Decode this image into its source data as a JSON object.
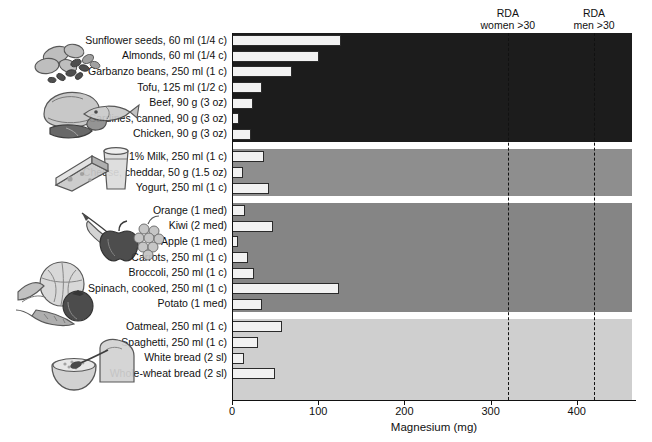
{
  "chart_data": {
    "type": "bar",
    "orientation": "horizontal",
    "title": "",
    "xlabel": "Magnesium (mg)",
    "ylabel": "",
    "xlim": [
      0,
      470
    ],
    "xticks": [
      0,
      100,
      200,
      300,
      400
    ],
    "grid": false,
    "legend": "none",
    "categories": [
      "Sunflower seeds, 60 ml (1/4 c)",
      "Almonds, 60 ml  (1/4 c)",
      "Garbanzo beans, 250 ml (1 c)",
      "Tofu, 125 ml (1/2 c)",
      "Beef, 90 g (3 oz)",
      "Sardines, canned, 90 g (3 oz)",
      "Chicken, 90 g (3 oz)",
      "1% Milk, 250 ml (1 c)",
      "Cheese, cheddar, 50 g (1.5 oz)",
      "Yogurt, 250 ml (1 c)",
      "Orange (1 med)",
      "Kiwi (2 med)",
      "Apple (1 med)",
      "Carrots, 250 ml (1 c)",
      "Broccoli, 250 ml (1 c)",
      "Spinach, cooked, 250 ml (1 c)",
      "Potato (1 med)",
      "Oatmeal, 250 ml (1 c)",
      "Spaghetti, 250 ml (1 c)",
      "White bread (2 sl)",
      "Whole-wheat bread (2 sl)"
    ],
    "values": [
      127,
      101,
      70,
      35,
      24,
      8,
      22,
      37,
      13,
      43,
      15,
      48,
      7,
      18,
      26,
      124,
      35,
      58,
      30,
      14,
      50
    ],
    "groups": [
      {
        "name": "protein-foods",
        "count": 7,
        "color": "#1c1c1c"
      },
      {
        "name": "dairy",
        "count": 3,
        "color": "#8e8e8e"
      },
      {
        "name": "fruits-and-vegetables",
        "count": 7,
        "color": "#858585"
      },
      {
        "name": "grains",
        "count": 4,
        "color": "#cfcfcf"
      }
    ],
    "annotations": [
      {
        "name": "rda-women",
        "line1": "RDA",
        "line2": "women >30",
        "value": 320
      },
      {
        "name": "rda-men",
        "line1": "RDA",
        "line2": "men >30",
        "value": 420
      }
    ],
    "bar_face_color": "#f2f2f2",
    "bar_edge_color": "#2b2b2b"
  },
  "illustrations": [
    {
      "name": "seeds-and-nuts-illustration"
    },
    {
      "name": "meat-poultry-fish-illustration"
    },
    {
      "name": "cheese-and-milk-illustration"
    },
    {
      "name": "fruit-illustration"
    },
    {
      "name": "vegetables-illustration"
    },
    {
      "name": "grains-bread-and-cereal-illustration"
    }
  ],
  "figure": {
    "caption": ""
  }
}
